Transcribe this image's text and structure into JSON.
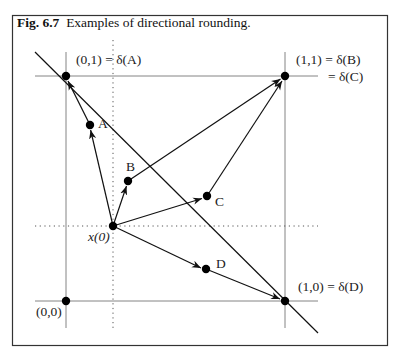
{
  "figure": {
    "caption_number": "Fig. 6.7",
    "caption_text": "Examples of directional rounding.",
    "colors": {
      "line": "#111111",
      "grid": "#555555",
      "background": "#ffffff",
      "frame": "#333333"
    },
    "labels": {
      "p01": "(0,1) = δ(A)",
      "p11_line1": "(1,1) = δ(B)",
      "p11_line2": "= δ(C)",
      "p10": "(1,0) = δ(D)",
      "p00": "(0,0)",
      "origin": "x(0)",
      "A": "A",
      "B": "B",
      "C": "C",
      "D": "D"
    },
    "points": [
      {
        "name": "(0,0)",
        "x": 66,
        "y": 301
      },
      {
        "name": "(0,1)",
        "x": 66,
        "y": 76
      },
      {
        "name": "(1,1)",
        "x": 285,
        "y": 76
      },
      {
        "name": "(1,0)",
        "x": 285,
        "y": 301
      },
      {
        "name": "x(0)",
        "x": 113,
        "y": 226
      },
      {
        "name": "A",
        "x": 90,
        "y": 125
      },
      {
        "name": "B",
        "x": 128,
        "y": 181
      },
      {
        "name": "C",
        "x": 207,
        "y": 196
      },
      {
        "name": "D",
        "x": 206,
        "y": 269
      }
    ],
    "arrows": [
      {
        "from": "x(0)",
        "to": "A"
      },
      {
        "from": "A",
        "to": "(0,1)"
      },
      {
        "from": "x(0)",
        "to": "B"
      },
      {
        "from": "B",
        "to": "(1,1)"
      },
      {
        "from": "x(0)",
        "to": "C"
      },
      {
        "from": "C",
        "to": "(1,1)"
      },
      {
        "from": "x(0)",
        "to": "D"
      },
      {
        "from": "D",
        "to": "(1,0)"
      }
    ]
  }
}
